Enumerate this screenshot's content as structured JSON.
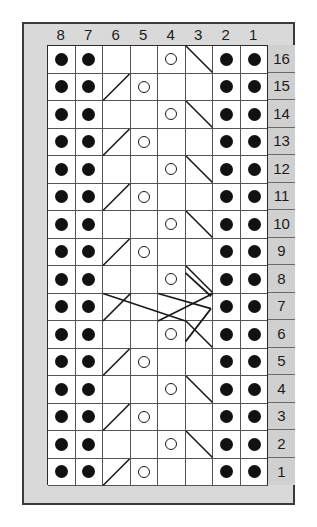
{
  "chart_data": {
    "type": "table",
    "columns": 8,
    "rows": 16,
    "column_labels": [
      "8",
      "7",
      "6",
      "5",
      "4",
      "3",
      "2",
      "1"
    ],
    "row_labels": [
      "16",
      "15",
      "14",
      "13",
      "12",
      "11",
      "10",
      "9",
      "8",
      "7",
      "6",
      "5",
      "4",
      "3",
      "2",
      "1"
    ],
    "symbols": {
      "purl": "filled-dot",
      "yarn_over": "open-circle",
      "decrease_right": "diagonal-up-right",
      "decrease_left": "diagonal-down-right",
      "cable": "long-diagonal-crossing"
    },
    "colors": {
      "panel_background": "#d9d9d9",
      "cell_background": "#ffffff",
      "grid_line": "#555555",
      "border": "#2b2b2b",
      "symbol": "#111111",
      "row_number_background": "#d0d0d0"
    },
    "grid": [
      {
        "row": "16",
        "cells": [
          "dot",
          "dot",
          "",
          "",
          "ring",
          "diag-down",
          "dot",
          "dot"
        ]
      },
      {
        "row": "15",
        "cells": [
          "dot",
          "dot",
          "diag-up",
          "ring",
          "",
          "",
          "dot",
          "dot"
        ]
      },
      {
        "row": "14",
        "cells": [
          "dot",
          "dot",
          "",
          "",
          "ring",
          "diag-down",
          "dot",
          "dot"
        ]
      },
      {
        "row": "13",
        "cells": [
          "dot",
          "dot",
          "diag-up",
          "ring",
          "",
          "",
          "dot",
          "dot"
        ]
      },
      {
        "row": "12",
        "cells": [
          "dot",
          "dot",
          "",
          "",
          "ring",
          "diag-down",
          "dot",
          "dot"
        ]
      },
      {
        "row": "11",
        "cells": [
          "dot",
          "dot",
          "diag-up",
          "ring",
          "",
          "",
          "dot",
          "dot"
        ]
      },
      {
        "row": "10",
        "cells": [
          "dot",
          "dot",
          "",
          "",
          "ring",
          "diag-down",
          "dot",
          "dot"
        ]
      },
      {
        "row": "9",
        "cells": [
          "dot",
          "dot",
          "diag-up",
          "ring",
          "",
          "",
          "dot",
          "dot"
        ]
      },
      {
        "row": "8",
        "cells": [
          "dot",
          "dot",
          "",
          "",
          "ring",
          "diag-down",
          "dot",
          "dot"
        ]
      },
      {
        "row": "7",
        "cells": [
          "dot",
          "dot",
          "cable",
          "cable",
          "cable",
          "cable",
          "dot",
          "dot"
        ]
      },
      {
        "row": "6",
        "cells": [
          "dot",
          "dot",
          "",
          "",
          "ring",
          "diag-down",
          "dot",
          "dot"
        ]
      },
      {
        "row": "5",
        "cells": [
          "dot",
          "dot",
          "diag-up",
          "ring",
          "",
          "",
          "dot",
          "dot"
        ]
      },
      {
        "row": "4",
        "cells": [
          "dot",
          "dot",
          "",
          "",
          "ring",
          "diag-down",
          "dot",
          "dot"
        ]
      },
      {
        "row": "3",
        "cells": [
          "dot",
          "dot",
          "diag-up",
          "ring",
          "",
          "",
          "dot",
          "dot"
        ]
      },
      {
        "row": "2",
        "cells": [
          "dot",
          "dot",
          "",
          "",
          "ring",
          "diag-down",
          "dot",
          "dot"
        ]
      },
      {
        "row": "1",
        "cells": [
          "dot",
          "dot",
          "diag-up",
          "ring",
          "",
          "",
          "dot",
          "dot"
        ]
      }
    ]
  }
}
